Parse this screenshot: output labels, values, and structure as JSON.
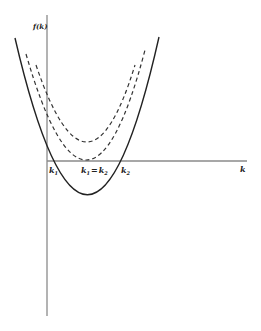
{
  "diagram": {
    "y_axis_label": "f(k)",
    "x_axis_label": "k",
    "labels": {
      "k1": "k",
      "k1_sub": "1",
      "k_eq_k1": "k",
      "k_eq_k1_sub": "1",
      "k_eq_eq": "=",
      "k_eq_k2": "k",
      "k_eq_k2_sub": "2",
      "k2": "k",
      "k2_sub": "2"
    },
    "curves": [
      {
        "name": "solid-parabola",
        "style": "solid",
        "description": "crosses axis at k1 and k2, minimum below axis"
      },
      {
        "name": "dashed-tangent-parabola",
        "style": "dashed",
        "description": "touches axis at k1 = k2"
      },
      {
        "name": "dashed-upper-parabola",
        "style": "dashed",
        "description": "entirely above axis"
      }
    ],
    "colors": {
      "line": "#222222",
      "axis": "#888888",
      "background": "#ffffff"
    }
  }
}
